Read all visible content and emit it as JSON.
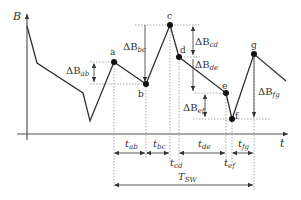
{
  "diagram": {
    "type": "waveform-annotation",
    "axes": {
      "y_label": "B",
      "x_label": "t"
    },
    "points": [
      {
        "id": "a",
        "label": "a"
      },
      {
        "id": "b",
        "label": "b"
      },
      {
        "id": "c",
        "label": "c"
      },
      {
        "id": "d",
        "label": "d"
      },
      {
        "id": "e",
        "label": "e"
      },
      {
        "id": "f",
        "label": "f"
      },
      {
        "id": "g",
        "label": "g"
      }
    ],
    "delta_b": [
      {
        "id": "ab",
        "main": "ΔB",
        "sub": "ab"
      },
      {
        "id": "bc",
        "main": "ΔB",
        "sub": "bc"
      },
      {
        "id": "cd",
        "main": "ΔB",
        "sub": "cd"
      },
      {
        "id": "de",
        "main": "ΔB",
        "sub": "de"
      },
      {
        "id": "ef",
        "main": "ΔB",
        "sub": "ef"
      },
      {
        "id": "fg",
        "main": "ΔB",
        "sub": "fg"
      }
    ],
    "intervals": [
      {
        "id": "ab",
        "main": "t",
        "sub": "ab"
      },
      {
        "id": "bc",
        "main": "t",
        "sub": "bc"
      },
      {
        "id": "cd",
        "main": "t",
        "sub": "cd"
      },
      {
        "id": "de",
        "main": "t",
        "sub": "de"
      },
      {
        "id": "ef",
        "main": "t",
        "sub": "ef"
      },
      {
        "id": "fg",
        "main": "t",
        "sub": "fg"
      }
    ],
    "period": {
      "main": "T",
      "sub": "SW"
    },
    "colors": {
      "curve": "#333333",
      "axis": "#555555",
      "guide": "#888888",
      "point": "#111111"
    }
  }
}
